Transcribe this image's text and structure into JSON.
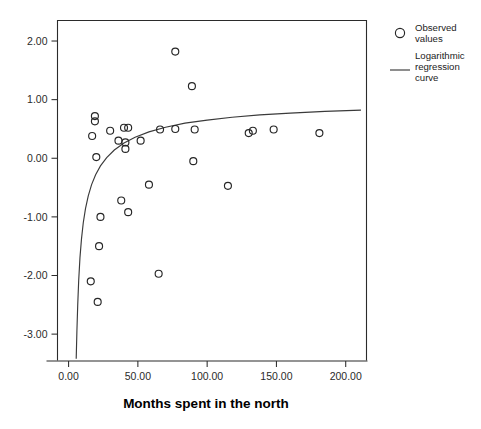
{
  "chart_data": {
    "type": "scatter",
    "title": "",
    "xlabel": "Months spent in the north",
    "ylabel": "",
    "xlim": [
      -8,
      215
    ],
    "ylim": [
      -3.45,
      2.35
    ],
    "xticks": [
      "0.00",
      "50.00",
      "100.00",
      "150.00",
      "200.00"
    ],
    "xtick_values": [
      0,
      50,
      100,
      150,
      200
    ],
    "yticks": [
      "2.00",
      "1.00",
      "0.00",
      "-1.00",
      "-2.00",
      "-3.00"
    ],
    "ytick_values": [
      2.0,
      1.0,
      0.0,
      -1.0,
      -2.0,
      -3.0
    ],
    "grid": false,
    "legend_position": "right",
    "series": [
      {
        "name": "Observed values",
        "marker": "open-circle",
        "points": [
          [
            77,
            1.82
          ],
          [
            89,
            1.23
          ],
          [
            19,
            0.72
          ],
          [
            19,
            0.63
          ],
          [
            20,
            0.02
          ],
          [
            17,
            0.38
          ],
          [
            30,
            0.47
          ],
          [
            40,
            0.52
          ],
          [
            43,
            0.52
          ],
          [
            36,
            0.3
          ],
          [
            41,
            0.27
          ],
          [
            41,
            0.16
          ],
          [
            52,
            0.3
          ],
          [
            66,
            0.49
          ],
          [
            77,
            0.5
          ],
          [
            91,
            0.49
          ],
          [
            130,
            0.43
          ],
          [
            133,
            0.47
          ],
          [
            148,
            0.49
          ],
          [
            181,
            0.43
          ],
          [
            90,
            -0.05
          ],
          [
            58,
            -0.45
          ],
          [
            115,
            -0.47
          ],
          [
            38,
            -0.72
          ],
          [
            43,
            -0.92
          ],
          [
            23,
            -1.0
          ],
          [
            22,
            -1.5
          ],
          [
            65,
            -1.97
          ],
          [
            16,
            -2.1
          ],
          [
            21,
            -2.45
          ]
        ]
      }
    ],
    "fit": {
      "name": "Logarithmic regression curve",
      "type": "logarithmic",
      "curve_points": [
        [
          5.5,
          -3.42
        ],
        [
          6.0,
          -2.95
        ],
        [
          6.6,
          -2.5
        ],
        [
          7.3,
          -2.08
        ],
        [
          8.2,
          -1.7
        ],
        [
          9.3,
          -1.38
        ],
        [
          10.6,
          -1.1
        ],
        [
          12.2,
          -0.86
        ],
        [
          14.2,
          -0.64
        ],
        [
          16.6,
          -0.45
        ],
        [
          19.5,
          -0.28
        ],
        [
          23.0,
          -0.13
        ],
        [
          27.5,
          0.01
        ],
        [
          33.0,
          0.14
        ],
        [
          40.0,
          0.26
        ],
        [
          48.0,
          0.36
        ],
        [
          58.0,
          0.45
        ],
        [
          70.0,
          0.53
        ],
        [
          84.0,
          0.6
        ],
        [
          100.0,
          0.65
        ],
        [
          118.0,
          0.7
        ],
        [
          138.0,
          0.74
        ],
        [
          160.0,
          0.77
        ],
        [
          185.0,
          0.8
        ],
        [
          211.0,
          0.82
        ]
      ]
    }
  },
  "legend": {
    "entries": [
      {
        "label_line1": "Observed",
        "label_line2": "values",
        "glyph": "open-circle"
      },
      {
        "label_line1": "Logarithmic",
        "label_line2": "regression",
        "label_line3": "curve",
        "glyph": "line-segment"
      }
    ]
  },
  "colors": {
    "marker_stroke": "#262626",
    "curve_stroke": "#3a3a3a",
    "frame": "#2b2b2b",
    "text": "#1a1a1a",
    "background": "#ffffff"
  }
}
